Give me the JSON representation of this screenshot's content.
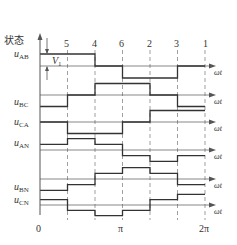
{
  "diagram": {
    "y_axis_title": "状态",
    "x_axis_label": "ωt",
    "x_ticks": [
      "0",
      "π",
      "2π"
    ],
    "state_sequence": [
      "5",
      "4",
      "6",
      "2",
      "3",
      "1"
    ],
    "annotation": {
      "symbol": "V",
      "subscript": "1"
    },
    "colors": {
      "waveform": "#333333",
      "axis": "#555555",
      "dashed": "#777777",
      "background": "#ffffff"
    }
  },
  "signals": [
    {
      "name": "u",
      "sub": "AB",
      "levels": [
        1,
        1,
        0,
        -1,
        -1,
        0
      ]
    },
    {
      "name": "u",
      "sub": "BC",
      "levels": [
        -1,
        0,
        1,
        1,
        0,
        -1
      ]
    },
    {
      "name": "u",
      "sub": "CA",
      "levels": [
        0,
        -1,
        -1,
        0,
        1,
        1
      ]
    },
    {
      "name": "u",
      "sub": "AN",
      "levels": [
        0.3333,
        0.6667,
        0.3333,
        -0.3333,
        -0.6667,
        -0.3333
      ]
    },
    {
      "name": "u",
      "sub": "BN",
      "levels": [
        -0.6667,
        -0.3333,
        0.3333,
        0.6667,
        0.3333,
        -0.3333
      ]
    },
    {
      "name": "u",
      "sub": "CN",
      "levels": [
        0.3333,
        -0.3333,
        -0.6667,
        -0.3333,
        0.3333,
        0.6667
      ]
    }
  ]
}
